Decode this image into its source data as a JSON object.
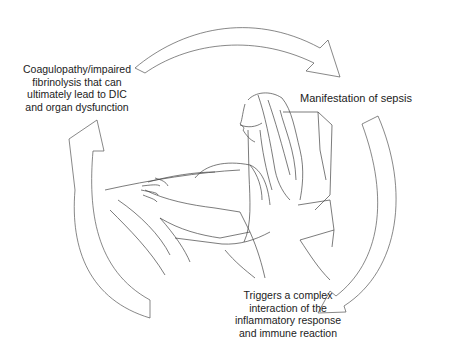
{
  "diagram": {
    "type": "cycle",
    "center_illustration": "patient-in-bed-with-oxygen-cannula",
    "stroke_color": "#555555",
    "steps": [
      {
        "id": "right",
        "text": "Manifestation of sepsis"
      },
      {
        "id": "bottom",
        "text": "Triggers a complex interaction of the inflammatory response and immune reaction",
        "lines": [
          "Triggers a complex",
          "interaction of the",
          "inflammatory response",
          "and immune reaction"
        ]
      },
      {
        "id": "left",
        "text": "Coagulopathy/impaired fibrinolysis that can ultimately lead to DIC and organ dysfunction",
        "lines": [
          "Coagulopathy/impaired",
          "fibrinolysis that can",
          "ultimately lead to DIC",
          "and organ dysfunction"
        ]
      }
    ],
    "arrows": [
      {
        "from": "left",
        "to": "right",
        "position": "top"
      },
      {
        "from": "right",
        "to": "bottom",
        "position": "right"
      },
      {
        "from": "bottom",
        "to": "left",
        "position": "left"
      }
    ]
  }
}
